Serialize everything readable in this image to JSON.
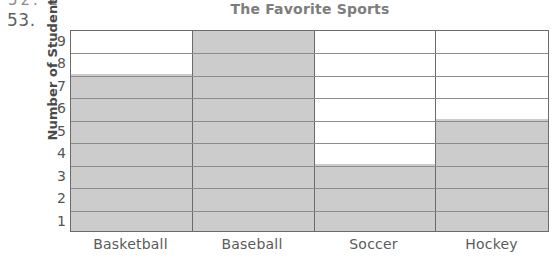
{
  "page": {
    "clipped_previous_item": "52.  2",
    "question_number": "53."
  },
  "chart_data": {
    "type": "bar",
    "title": "The Favorite Sports",
    "xlabel": "",
    "ylabel": "Number of Students",
    "categories": [
      "Basketball",
      "Baseball",
      "Soccer",
      "Hockey"
    ],
    "values": [
      7,
      9,
      3,
      5
    ],
    "ytick_labels": [
      "9",
      "8",
      "7",
      "6",
      "5",
      "4",
      "3",
      "2",
      "1"
    ],
    "ylim": [
      0,
      9
    ],
    "ytick_step": 1,
    "grid": true,
    "legend": "none",
    "bar_fill_color": "#cccccc",
    "bar_border_color": "#6b6b6b",
    "gridline_color": "#8c8c8c",
    "title_color": "#7d7d7d",
    "axis_text_color": "#555555"
  }
}
